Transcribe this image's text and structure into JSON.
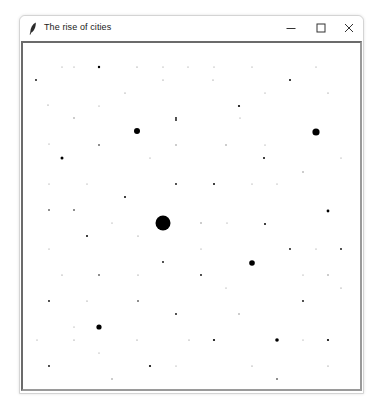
{
  "window": {
    "title": "The rise of cities",
    "app_icon": "feather-icon",
    "controls": {
      "minimize": "minimize-icon",
      "maximize": "maximize-icon",
      "close": "close-icon"
    }
  },
  "canvas": {
    "background": "#ffffff",
    "dot_color": "#000000",
    "cities": [
      {
        "x": 36,
        "y": 80,
        "r": 0.9
      },
      {
        "x": 62,
        "y": 67,
        "r": 0.5
      },
      {
        "x": 74,
        "y": 67,
        "r": 0.5
      },
      {
        "x": 99,
        "y": 67,
        "r": 1.2
      },
      {
        "x": 137,
        "y": 67,
        "r": 0.6
      },
      {
        "x": 163,
        "y": 67,
        "r": 0.5
      },
      {
        "x": 188,
        "y": 67,
        "r": 0.5
      },
      {
        "x": 214,
        "y": 67,
        "r": 0.5
      },
      {
        "x": 252,
        "y": 67,
        "r": 0.5
      },
      {
        "x": 316,
        "y": 67,
        "r": 0.5
      },
      {
        "x": 48,
        "y": 105,
        "r": 0.6
      },
      {
        "x": 74,
        "y": 118,
        "r": 0.7
      },
      {
        "x": 125,
        "y": 93,
        "r": 0.6
      },
      {
        "x": 163,
        "y": 80,
        "r": 0.6
      },
      {
        "x": 176,
        "y": 118,
        "r": 0.9
      },
      {
        "x": 213,
        "y": 80,
        "r": 0.6
      },
      {
        "x": 239,
        "y": 106,
        "r": 1.1
      },
      {
        "x": 265,
        "y": 93,
        "r": 0.5
      },
      {
        "x": 290,
        "y": 80,
        "r": 1
      },
      {
        "x": 328,
        "y": 93,
        "r": 0.6
      },
      {
        "x": 99,
        "y": 106,
        "r": 0.5
      },
      {
        "x": 137,
        "y": 131,
        "r": 3
      },
      {
        "x": 176,
        "y": 120,
        "r": 0.9
      },
      {
        "x": 240,
        "y": 118,
        "r": 0.5
      },
      {
        "x": 316,
        "y": 132,
        "r": 3.6
      },
      {
        "x": 49,
        "y": 144,
        "r": 0.5
      },
      {
        "x": 99,
        "y": 145,
        "r": 0.8
      },
      {
        "x": 176,
        "y": 145,
        "r": 0.7
      },
      {
        "x": 226,
        "y": 145,
        "r": 0.7
      },
      {
        "x": 265,
        "y": 145,
        "r": 0.5
      },
      {
        "x": 62,
        "y": 158,
        "r": 1.5
      },
      {
        "x": 150,
        "y": 158,
        "r": 0.5
      },
      {
        "x": 264,
        "y": 158,
        "r": 1
      },
      {
        "x": 341,
        "y": 158,
        "r": 0.5
      },
      {
        "x": 49,
        "y": 184,
        "r": 0.5
      },
      {
        "x": 87,
        "y": 184,
        "r": 0.5
      },
      {
        "x": 176,
        "y": 184,
        "r": 0.9
      },
      {
        "x": 214,
        "y": 184,
        "r": 1
      },
      {
        "x": 252,
        "y": 184,
        "r": 0.5
      },
      {
        "x": 277,
        "y": 184,
        "r": 0.5
      },
      {
        "x": 303,
        "y": 172,
        "r": 0.7
      },
      {
        "x": 125,
        "y": 197,
        "r": 1
      },
      {
        "x": 49,
        "y": 210,
        "r": 0.8
      },
      {
        "x": 74,
        "y": 210,
        "r": 0.8
      },
      {
        "x": 328,
        "y": 211,
        "r": 1.4
      },
      {
        "x": 112,
        "y": 223,
        "r": 0.5
      },
      {
        "x": 163,
        "y": 223,
        "r": 7.5
      },
      {
        "x": 201,
        "y": 223,
        "r": 0.7
      },
      {
        "x": 227,
        "y": 223,
        "r": 0.5
      },
      {
        "x": 265,
        "y": 224,
        "r": 1
      },
      {
        "x": 87,
        "y": 236,
        "r": 1
      },
      {
        "x": 138,
        "y": 236,
        "r": 0.6
      },
      {
        "x": 49,
        "y": 249,
        "r": 0.5
      },
      {
        "x": 201,
        "y": 249,
        "r": 0.5
      },
      {
        "x": 290,
        "y": 249,
        "r": 0.9
      },
      {
        "x": 316,
        "y": 249,
        "r": 0.5
      },
      {
        "x": 341,
        "y": 249,
        "r": 0.9
      },
      {
        "x": 163,
        "y": 262,
        "r": 0.9
      },
      {
        "x": 252,
        "y": 263,
        "r": 2.8
      },
      {
        "x": 62,
        "y": 275,
        "r": 0.6
      },
      {
        "x": 99,
        "y": 275,
        "r": 0.8
      },
      {
        "x": 138,
        "y": 275,
        "r": 0.6
      },
      {
        "x": 201,
        "y": 275,
        "r": 0.9
      },
      {
        "x": 303,
        "y": 275,
        "r": 0.5
      },
      {
        "x": 328,
        "y": 275,
        "r": 0.7
      },
      {
        "x": 226,
        "y": 288,
        "r": 0.5
      },
      {
        "x": 341,
        "y": 288,
        "r": 0.6
      },
      {
        "x": 49,
        "y": 301,
        "r": 0.9
      },
      {
        "x": 87,
        "y": 301,
        "r": 0.6
      },
      {
        "x": 138,
        "y": 301,
        "r": 0.8
      },
      {
        "x": 303,
        "y": 301,
        "r": 0.9
      },
      {
        "x": 176,
        "y": 314,
        "r": 0.9
      },
      {
        "x": 239,
        "y": 314,
        "r": 0.7
      },
      {
        "x": 74,
        "y": 327,
        "r": 0.5
      },
      {
        "x": 99,
        "y": 327,
        "r": 2.6
      },
      {
        "x": 37,
        "y": 340,
        "r": 0.5
      },
      {
        "x": 74,
        "y": 340,
        "r": 0.6
      },
      {
        "x": 137,
        "y": 340,
        "r": 0.6
      },
      {
        "x": 189,
        "y": 340,
        "r": 0.6
      },
      {
        "x": 214,
        "y": 340,
        "r": 1.1
      },
      {
        "x": 277,
        "y": 340,
        "r": 1.8
      },
      {
        "x": 303,
        "y": 340,
        "r": 0.5
      },
      {
        "x": 328,
        "y": 340,
        "r": 1.1
      },
      {
        "x": 99,
        "y": 353,
        "r": 0.5
      },
      {
        "x": 49,
        "y": 366,
        "r": 0.9
      },
      {
        "x": 150,
        "y": 366,
        "r": 1.1
      },
      {
        "x": 176,
        "y": 366,
        "r": 0.5
      },
      {
        "x": 252,
        "y": 366,
        "r": 0.6
      },
      {
        "x": 328,
        "y": 366,
        "r": 0.6
      },
      {
        "x": 112,
        "y": 379,
        "r": 0.7
      },
      {
        "x": 277,
        "y": 379,
        "r": 0.8
      }
    ]
  }
}
